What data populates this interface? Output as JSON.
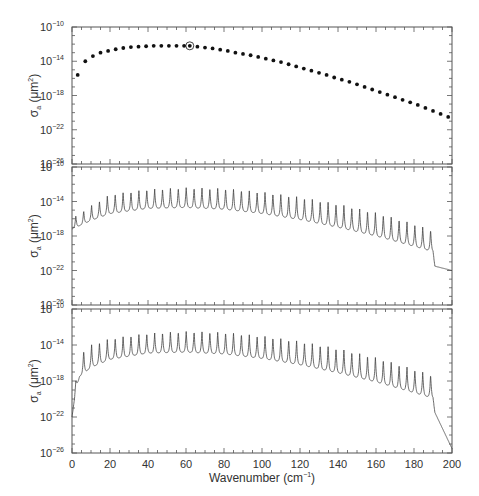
{
  "chart_data": [
    {
      "panel": "top",
      "type": "scatter",
      "title": "",
      "xlabel": "",
      "ylabel": "σa (μm²)",
      "yscale": "log",
      "ylim": [
        1e-26,
        1e-10
      ],
      "xlim": [
        0,
        200
      ],
      "yticks": [
        "10^-10",
        "10^-14",
        "10^-18",
        "10^-22",
        "10^-26"
      ],
      "grid": false,
      "highlighted_point": {
        "x": 62,
        "y_exp": -12.2
      },
      "x": [
        3,
        7,
        11,
        15,
        19,
        23,
        27,
        31,
        35,
        39,
        43,
        47,
        51,
        55,
        59,
        62,
        66,
        70,
        74,
        78,
        82,
        86,
        90,
        94,
        98,
        102,
        106,
        110,
        114,
        118,
        122,
        126,
        130,
        134,
        138,
        142,
        146,
        150,
        154,
        158,
        162,
        166,
        170,
        174,
        178,
        182,
        186,
        190,
        194,
        198
      ],
      "y_exp": [
        -15.6,
        -14.0,
        -13.4,
        -13.0,
        -12.8,
        -12.6,
        -12.45,
        -12.35,
        -12.3,
        -12.25,
        -12.2,
        -12.2,
        -12.2,
        -12.2,
        -12.2,
        -12.2,
        -12.3,
        -12.4,
        -12.5,
        -12.65,
        -12.8,
        -13.0,
        -13.15,
        -13.3,
        -13.5,
        -13.7,
        -13.9,
        -14.1,
        -14.35,
        -14.6,
        -14.85,
        -15.1,
        -15.35,
        -15.6,
        -15.9,
        -16.15,
        -16.4,
        -16.7,
        -17.0,
        -17.3,
        -17.6,
        -17.9,
        -18.2,
        -18.5,
        -18.8,
        -19.1,
        -19.45,
        -19.8,
        -20.15,
        -20.5
      ]
    },
    {
      "panel": "middle",
      "type": "line",
      "xlabel": "",
      "ylabel": "σa (μm²)",
      "yscale": "log",
      "ylim": [
        1e-26,
        1e-10
      ],
      "xlim": [
        0,
        200
      ],
      "yticks": [
        "10^-10",
        "10^-14",
        "10^-18",
        "10^-22",
        "10^-26"
      ],
      "description": "periodic absorption peaks every ~4 cm⁻¹ superimposed on a smooth envelope; sharp drop after ~190",
      "envelope_x": [
        0,
        10,
        20,
        40,
        60,
        80,
        100,
        120,
        140,
        160,
        180,
        190,
        191,
        200
      ],
      "baseline_exp": [
        -17.2,
        -16.2,
        -15.4,
        -14.8,
        -14.7,
        -14.9,
        -15.4,
        -16.1,
        -17.0,
        -18.0,
        -19.2,
        -19.8,
        -21.5,
        -22.0
      ],
      "peak_exp": [
        -16.0,
        -14.5,
        -13.2,
        -12.6,
        -12.4,
        -12.5,
        -12.9,
        -13.5,
        -14.3,
        -15.3,
        -16.6,
        -17.4,
        -21.5,
        -22.0
      ]
    },
    {
      "panel": "bottom",
      "type": "line",
      "xlabel": "Wavenumber (cm⁻¹)",
      "ylabel": "σa (μm²)",
      "yscale": "log",
      "ylim": [
        1e-26,
        1e-10
      ],
      "xlim": [
        0,
        200
      ],
      "xticks": [
        0,
        20,
        40,
        60,
        80,
        100,
        120,
        140,
        160,
        180,
        200
      ],
      "yticks": [
        "10^-10",
        "10^-14",
        "10^-18",
        "10^-22",
        "10^-26"
      ],
      "description": "periodic absorption peaks every ~4 cm⁻¹; steep rise near 0, drop after ~190",
      "envelope_x": [
        0,
        2,
        4,
        10,
        20,
        40,
        60,
        80,
        100,
        120,
        140,
        160,
        180,
        190,
        191,
        200
      ],
      "baseline_exp": [
        -22.0,
        -19.0,
        -17.5,
        -16.5,
        -15.6,
        -14.9,
        -14.8,
        -15.0,
        -15.5,
        -16.2,
        -17.1,
        -18.1,
        -19.3,
        -19.9,
        -21.5,
        -25.5
      ],
      "peak_exp": [
        -22.0,
        -18.0,
        -15.0,
        -14.0,
        -13.3,
        -12.7,
        -12.5,
        -12.6,
        -13.0,
        -13.6,
        -14.4,
        -15.4,
        -16.7,
        -17.4,
        -21.5,
        -25.5
      ]
    }
  ],
  "labels": {
    "ylabel_main": "σ",
    "ylabel_sub": "a",
    "ylabel_unit_pre": " (μm",
    "ylabel_unit_sup": "2",
    "ylabel_unit_post": ")",
    "xlabel_main": "Wavenumber (cm",
    "xlabel_sup": "−1",
    "xlabel_post": ")",
    "ytick_base": "10",
    "ytick_exps": [
      "−10",
      "−14",
      "−18",
      "−22",
      "−26"
    ],
    "xticks": [
      "0",
      "20",
      "40",
      "60",
      "80",
      "100",
      "120",
      "140",
      "160",
      "180",
      "200"
    ]
  },
  "colors": {
    "axis": "#555555",
    "dots": "#111111",
    "line": "#444444"
  }
}
